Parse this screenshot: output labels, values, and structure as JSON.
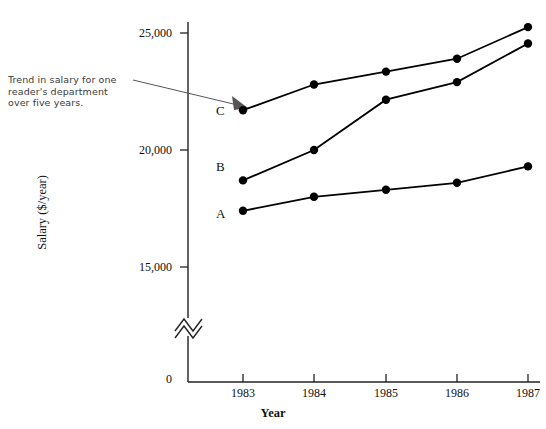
{
  "chart_data": {
    "type": "line",
    "title": "",
    "xlabel": "Year",
    "ylabel": "Salary ($/year)",
    "categories": [
      "1983",
      "1984",
      "1985",
      "1986",
      "1987"
    ],
    "x": [
      1983,
      1984,
      1985,
      1986,
      1987
    ],
    "series": [
      {
        "name": "A",
        "values": [
          17400,
          18000,
          18300,
          18600,
          19300
        ]
      },
      {
        "name": "B",
        "values": [
          18700,
          20000,
          22150,
          22900,
          24550
        ]
      },
      {
        "name": "C",
        "values": [
          21700,
          22800,
          23350,
          23900,
          25250
        ]
      }
    ],
    "ylim": [
      0,
      26200
    ],
    "yticks": [
      0,
      15000,
      20000,
      25000
    ],
    "ytick_labels": [
      "0",
      "15,000",
      "20,000",
      "25,000"
    ],
    "xticks": [
      1983,
      1984,
      1985,
      1986,
      1987
    ],
    "grid": false,
    "legend": "inline-point-labels",
    "axis_break": true,
    "axis_break_note": "double zigzag break on y-axis between 0 and 15,000",
    "marker": "filled-circle",
    "line_color": "#000000",
    "annotations": [
      {
        "text": "Trend in salary for one reader's department over five years.",
        "target_series": "C",
        "target_point": "1983",
        "arrow": true
      }
    ]
  },
  "axis": {
    "y_title": "Salary ($/year)",
    "x_title": "Year",
    "y_ticks": [
      {
        "label": "25,000",
        "value": 25000
      },
      {
        "label": "20,000",
        "value": 20000
      },
      {
        "label": "15,000",
        "value": 15000
      },
      {
        "label": "0",
        "value": 0
      }
    ],
    "x_ticks": [
      {
        "label": "1983"
      },
      {
        "label": "1984"
      },
      {
        "label": "1985"
      },
      {
        "label": "1986"
      },
      {
        "label": "1987"
      }
    ]
  },
  "series_labels": [
    {
      "label": "C"
    },
    {
      "label": "B"
    },
    {
      "label": "A"
    }
  ],
  "annotation": {
    "text": "Trend in salary for one reader's department over five years."
  },
  "colors": {
    "line": "#000000",
    "marker": "#000000",
    "axis": "#222222",
    "annotation_text": "#3a3a3a",
    "annotation_leader": "#555555",
    "background": "#ffffff"
  }
}
